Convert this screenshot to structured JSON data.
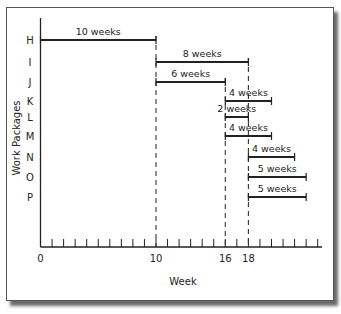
{
  "caption_fragment": "...",
  "chart_data": {
    "type": "gantt",
    "title": "",
    "xlabel": "Week",
    "ylabel": "Work Packages",
    "x_ticks_labeled": [
      0,
      10,
      16,
      18
    ],
    "x_range": [
      0,
      24
    ],
    "minor_tick_interval": 1,
    "milestone_lines": [
      10,
      16,
      18
    ],
    "categories": [
      "H",
      "I",
      "J",
      "K",
      "L",
      "M",
      "N",
      "O",
      "P"
    ],
    "tasks": [
      {
        "name": "H",
        "start": 0,
        "duration": 10,
        "label": "10 weeks"
      },
      {
        "name": "I",
        "start": 10,
        "duration": 8,
        "label": "8 weeks"
      },
      {
        "name": "J",
        "start": 10,
        "duration": 6,
        "label": "6 weeks"
      },
      {
        "name": "K",
        "start": 16,
        "duration": 4,
        "label": "4 weeks"
      },
      {
        "name": "L",
        "start": 16,
        "duration": 2,
        "label": "2 weeks"
      },
      {
        "name": "M",
        "start": 16,
        "duration": 4,
        "label": "4 weeks"
      },
      {
        "name": "N",
        "start": 18,
        "duration": 4,
        "label": "4 weeks"
      },
      {
        "name": "O",
        "start": 18,
        "duration": 5,
        "label": "5 weeks"
      },
      {
        "name": "P",
        "start": 18,
        "duration": 5,
        "label": "5 weeks"
      }
    ]
  }
}
